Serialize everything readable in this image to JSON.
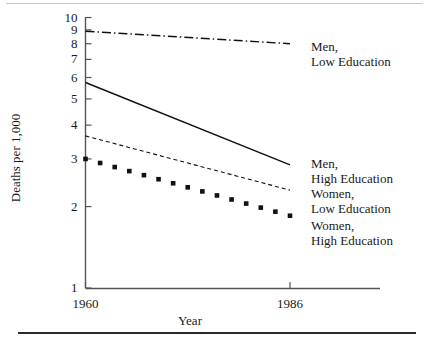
{
  "chart_data": {
    "type": "line",
    "title": "",
    "xlabel": "Year",
    "ylabel": "Deaths per 1,000",
    "x": [
      1960,
      1986
    ],
    "xlim": [
      1957,
      1990
    ],
    "ylim": [
      1,
      10
    ],
    "yscale": "log",
    "grid": false,
    "legend_position": "right-inline",
    "y_ticks": [
      {
        "value": 10,
        "label": "10"
      },
      {
        "value": 9,
        "label": "9"
      },
      {
        "value": 8,
        "label": "8"
      },
      {
        "value": 7,
        "label": "7"
      },
      {
        "value": 6,
        "label": "6"
      },
      {
        "value": 5,
        "label": "5"
      },
      {
        "value": 4,
        "label": "4"
      },
      {
        "value": 3,
        "label": "3"
      },
      {
        "value": 2,
        "label": "2"
      },
      {
        "value": 1,
        "label": "1"
      }
    ],
    "x_ticks": [
      {
        "value": 1960,
        "label": "1960"
      },
      {
        "value": 1986,
        "label": "1986"
      }
    ],
    "series": [
      {
        "name": "Men, Low Education",
        "label_line1": "Men,",
        "label_line2": "Low Education",
        "style": "dash-dot",
        "color": "#111111",
        "values": [
          8.9,
          8.0
        ]
      },
      {
        "name": "Men, High Education",
        "label_line1": "Men,",
        "label_line2": "High Education",
        "style": "solid",
        "color": "#111111",
        "values": [
          5.75,
          2.85
        ]
      },
      {
        "name": "Women, Low Education",
        "label_line1": "Women,",
        "label_line2": "Low Education",
        "style": "dashed",
        "color": "#111111",
        "values": [
          3.65,
          2.3
        ]
      },
      {
        "name": "Women, High Education",
        "label_line1": "Women,",
        "label_line2": "High Education",
        "style": "dotted",
        "color": "#111111",
        "values": [
          3.0,
          1.85
        ]
      }
    ]
  },
  "axes": {
    "y_title": "Deaths per 1,000",
    "x_title": "Year"
  }
}
